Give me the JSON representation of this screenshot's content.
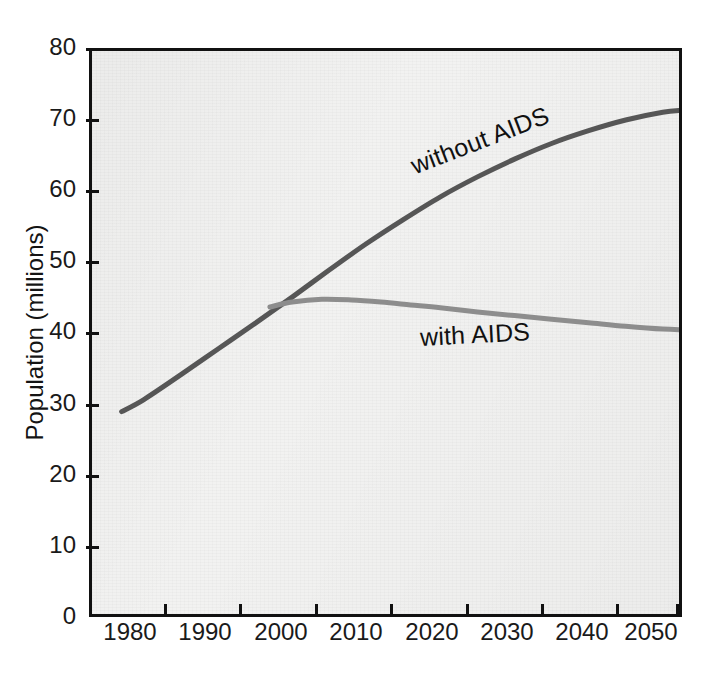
{
  "chart_data": {
    "type": "line",
    "title": "",
    "subtitle": "",
    "xlabel": "",
    "ylabel": "Population (millions)",
    "xlim": [
      1973,
      2053
    ],
    "ylim": [
      0,
      80
    ],
    "grid": false,
    "legend_position": "inline-annotations",
    "x_ticks": [
      1980,
      1990,
      2000,
      2010,
      2020,
      2030,
      2040,
      2050
    ],
    "x_tick_labels": [
      "1980",
      "1990",
      "2000",
      "2010",
      "2020",
      "2030",
      "2040",
      "2050"
    ],
    "y_ticks": [
      0,
      10,
      20,
      30,
      40,
      50,
      60,
      70,
      80
    ],
    "y_tick_labels": [
      "0",
      "10",
      "20",
      "30",
      "40",
      "50",
      "60",
      "70",
      "80"
    ],
    "series": [
      {
        "name": "without AIDS",
        "color": "#565656",
        "line_width": 5,
        "x": [
          1977,
          1980,
          1985,
          1990,
          1995,
          2000,
          2005,
          2010,
          2015,
          2020,
          2025,
          2030,
          2035,
          2040,
          2045,
          2050,
          2053
        ],
        "values": [
          29.3,
          31.0,
          34.5,
          38.1,
          41.7,
          45.4,
          49.2,
          52.9,
          56.3,
          59.5,
          62.3,
          64.8,
          67.0,
          68.8,
          70.3,
          71.4,
          71.7
        ]
      },
      {
        "name": "with AIDS",
        "color": "#8d8d8d",
        "line_width": 5,
        "x": [
          1997,
          2000,
          2004,
          2008,
          2012,
          2016,
          2020,
          2025,
          2030,
          2035,
          2040,
          2045,
          2050,
          2053
        ],
        "values": [
          44.0,
          44.7,
          45.1,
          45.0,
          44.7,
          44.3,
          43.9,
          43.3,
          42.8,
          42.3,
          41.8,
          41.3,
          40.9,
          40.8
        ]
      }
    ],
    "annotations": [
      {
        "text": "without AIDS",
        "x": 2017,
        "y": 62.0,
        "rotation": -21
      },
      {
        "text": "with AIDS",
        "x": 2018,
        "y": 40.0,
        "rotation": -3
      }
    ],
    "notes": {
      "divergence_year": 1997,
      "divergence_value": 44.0,
      "with_aids_peak_year": 2004,
      "with_aids_peak_value": 45.1
    }
  },
  "axes": {
    "y_title": "Population (millions)"
  },
  "labels": {
    "y": {
      "t80": "80",
      "t70": "70",
      "t60": "60",
      "t50": "50",
      "t40": "40",
      "t30": "30",
      "t20": "20",
      "t10": "10",
      "t0": "0"
    },
    "x": {
      "t1980": "1980",
      "t1990": "1990",
      "t2000": "2000",
      "t2010": "2010",
      "t2020": "2020",
      "t2030": "2030",
      "t2040": "2040",
      "t2050": "2050"
    }
  },
  "series_labels": {
    "without_aids": "without AIDS",
    "with_aids": "with AIDS"
  },
  "colors": {
    "without_aids_line": "#565656",
    "with_aids_line": "#8d8d8d",
    "axis": "#111111",
    "plot_background": "#f2f2f1",
    "page_background": "#ffffff",
    "text": "#1a1a1a"
  }
}
